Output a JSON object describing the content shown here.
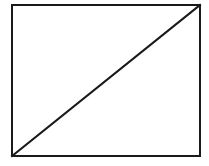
{
  "diagram": {
    "width": 209,
    "height": 166,
    "background": "#ffffff",
    "stroke_color": "#1a1a1a",
    "stroke_width": 2,
    "rectangle": {
      "x": 12,
      "y": 5,
      "width": 188,
      "height": 151
    },
    "diagonal": {
      "x1": 12,
      "y1": 156,
      "x2": 200,
      "y2": 5
    }
  }
}
